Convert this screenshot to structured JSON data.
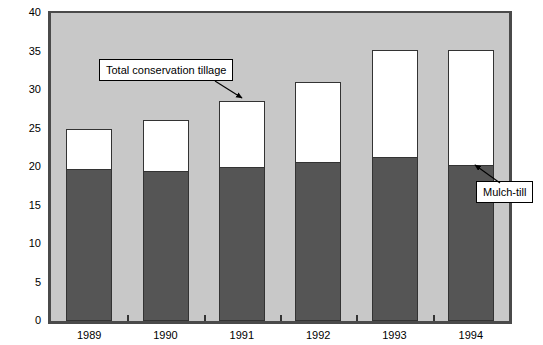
{
  "chart_data": {
    "type": "bar",
    "subtype": "stacked",
    "title": "",
    "xlabel": "",
    "ylabel": "U.S. farm land (%)",
    "ylim": [
      0,
      40
    ],
    "ytick_step": 5,
    "yticks": [
      0,
      5,
      10,
      15,
      20,
      25,
      30,
      35,
      40
    ],
    "ytick_labels": [
      "0",
      "5",
      "10",
      "15",
      "20",
      "25",
      "30",
      "35",
      "40"
    ],
    "categories": [
      "1989",
      "1990",
      "1991",
      "1992",
      "1993",
      "1994"
    ],
    "grid": false,
    "legend": "none",
    "plot_background": "#c8c8c8",
    "series": [
      {
        "name": "Mulch-till",
        "color": "#555555",
        "values": [
          19.8,
          19.5,
          20.0,
          20.7,
          21.3,
          20.2
        ]
      },
      {
        "name": "Total conservation tillage",
        "color": "#ffffff",
        "note": "Bar top = total conservation tillage; white segment is remainder above mulch-till",
        "values": [
          25.0,
          26.1,
          28.6,
          31.1,
          35.2,
          35.2
        ]
      }
    ],
    "annotations": [
      {
        "id": "callout-total",
        "text": "Total conservation tillage",
        "points_to": "1991"
      },
      {
        "id": "callout-mulch",
        "text": "Mulch-till",
        "points_to": "1994"
      }
    ]
  }
}
